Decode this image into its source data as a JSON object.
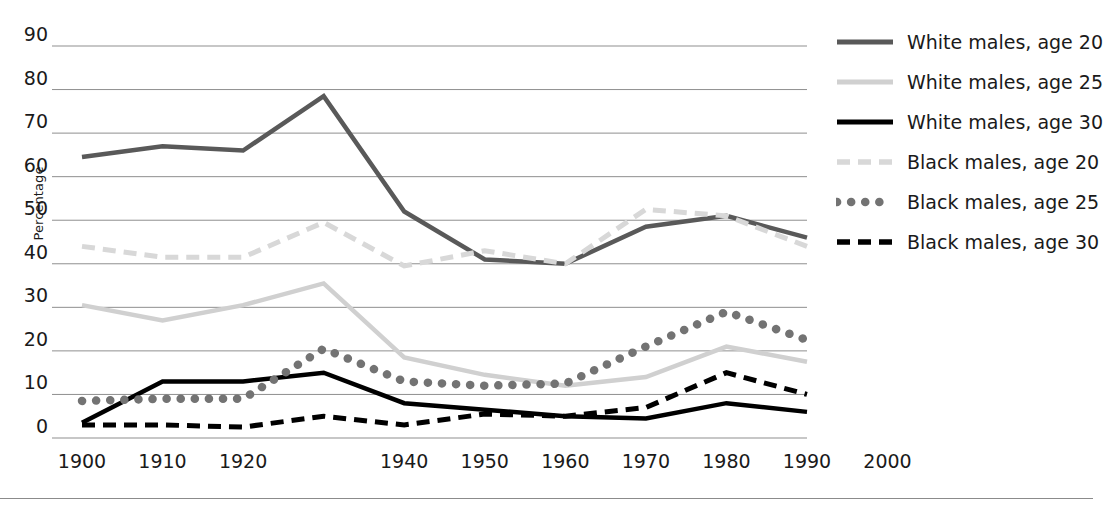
{
  "chart_data": {
    "type": "line",
    "title": "",
    "xlabel": "",
    "ylabel": "Percentage",
    "x": [
      1900,
      1910,
      1920,
      1930,
      1940,
      1950,
      1960,
      1970,
      1980,
      1990,
      2000
    ],
    "categories": [
      "1900",
      "1910",
      "1920",
      "1940",
      "1950",
      "1960",
      "1970",
      "1980",
      "1990",
      "2000"
    ],
    "tick_labels_x": [
      "1900",
      "1910",
      "1920",
      "1940",
      "1950",
      "1960",
      "1970",
      "1980",
      "1990",
      "2000"
    ],
    "tick_labels_y": [
      "0",
      "10",
      "20",
      "30",
      "40",
      "50",
      "60",
      "70",
      "80",
      "90"
    ],
    "ylim": [
      0,
      90
    ],
    "ytick_step": 10,
    "grid": true,
    "legend_position": "right",
    "series": [
      {
        "name": "White males, age 20",
        "style": "solid",
        "color": "#595959",
        "values": [
          64.5,
          67.0,
          66.0,
          78.5,
          52.0,
          41.0,
          40.0,
          48.5,
          51.0,
          46.0
        ]
      },
      {
        "name": "White males, age 25",
        "style": "solid",
        "color": "#d0d0d0",
        "values": [
          30.5,
          27.0,
          30.5,
          35.5,
          18.5,
          14.5,
          12.0,
          14.0,
          21.0,
          17.5
        ]
      },
      {
        "name": "White males, age 30",
        "style": "solid",
        "color": "#000000",
        "values": [
          3.5,
          13.0,
          13.0,
          15.0,
          8.0,
          6.5,
          5.0,
          4.5,
          8.0,
          6.0
        ]
      },
      {
        "name": "Black males, age 20",
        "style": "dashed",
        "color": "#d8d8d8",
        "values": [
          44.0,
          41.5,
          41.5,
          49.5,
          39.5,
          43.0,
          40.0,
          52.5,
          51.0,
          44.0
        ]
      },
      {
        "name": "Black males, age 25",
        "style": "dotted",
        "color": "#737373",
        "values": [
          8.5,
          9.0,
          9.0,
          20.5,
          13.0,
          12.0,
          12.5,
          21.0,
          29.0,
          22.5
        ]
      },
      {
        "name": "Black males, age 30",
        "style": "dashed",
        "color": "#000000",
        "values": [
          3.0,
          3.0,
          2.5,
          5.0,
          3.0,
          5.5,
          5.0,
          7.0,
          15.0,
          10.0
        ]
      }
    ]
  },
  "axis": {
    "y_title": "Percentage"
  },
  "legend": {
    "items": [
      {
        "label": "White males, age 20"
      },
      {
        "label": "White males, age 25"
      },
      {
        "label": "White males, age 30"
      },
      {
        "label": "Black males, age 20"
      },
      {
        "label": "Black males, age 25"
      },
      {
        "label": "Black males, age 30"
      }
    ]
  }
}
